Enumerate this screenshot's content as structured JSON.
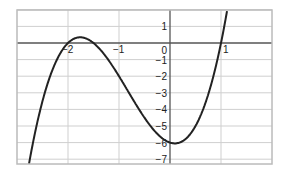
{
  "chart_data": {
    "type": "line",
    "title": "",
    "xlabel": "",
    "ylabel": "",
    "xlim": [
      -3,
      2
    ],
    "ylim": [
      -7.33,
      2
    ],
    "grid": true,
    "x_ticks": [
      -2,
      -1,
      0,
      1
    ],
    "x_tick_labels": [
      "-2",
      "-1",
      "0",
      "1"
    ],
    "y_ticks": [
      1,
      0,
      -1,
      -2,
      -3,
      -4,
      -5,
      -6,
      -7
    ],
    "y_tick_labels": [
      "1",
      "0",
      "-1",
      "-2",
      "-3",
      "-4",
      "-5",
      "-6",
      "-7"
    ],
    "series": [
      {
        "name": "f(x) = 2(x+2)(x+1.5)(x-1)",
        "color": "#222222",
        "x": [
          -2.78,
          -2.5,
          -2.25,
          -2.0,
          -1.76,
          -1.5,
          -1.25,
          -1.0,
          -0.75,
          -0.5,
          -0.25,
          0.0,
          0.1,
          0.25,
          0.5,
          0.75,
          1.0,
          1.12
        ],
        "y": [
          -7.55,
          -3.0,
          -1.07,
          0.0,
          0.34,
          0.0,
          -0.84,
          -2.0,
          -3.28,
          -4.5,
          -5.47,
          -6.0,
          -6.05,
          -5.91,
          -5.0,
          -3.16,
          0.0,
          1.96
        ]
      }
    ],
    "annotations": {
      "roots": [
        -2,
        -1.5,
        1
      ],
      "local_max": [
        -1.76,
        0.34
      ],
      "local_min": [
        0.1,
        -6.05
      ]
    }
  }
}
